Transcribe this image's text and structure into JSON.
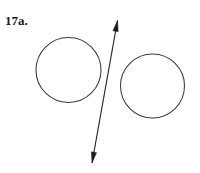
{
  "figure": {
    "label": "17a.",
    "background_color": "#ffffff",
    "stroke_color": "#3c3c3c",
    "arrow_color": "#1c1c1c",
    "width": 200,
    "height": 173,
    "shapes": {
      "circles": [
        {
          "name": "left-circle",
          "cx": 68.5,
          "cy": 70.0,
          "r": 32.5
        },
        {
          "name": "right-circle",
          "cx": 152.5,
          "cy": 86.0,
          "r": 32.0
        }
      ],
      "arrow": {
        "name": "double-headed-arrow",
        "x1": 117.5,
        "y1": 20.5,
        "x2": 92.0,
        "y2": 163.0,
        "heads": "both",
        "head_length": 11,
        "head_width": 5.4
      }
    }
  }
}
